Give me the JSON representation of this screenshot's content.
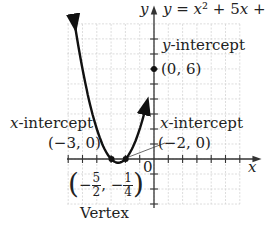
{
  "chart_data": {
    "type": "line",
    "equation_label": "y = x² + 5x +",
    "xlabel": "x",
    "ylabel": "y",
    "xlim": [
      -6,
      6
    ],
    "ylim": [
      -3,
      9
    ],
    "grid": true,
    "origin_label": "0",
    "series": [
      {
        "name": "y = x^2 + 5x + 6",
        "x": [
          -5.5,
          -5,
          -4,
          -3,
          -2.5,
          -2,
          -1,
          -0.5
        ],
        "y": [
          8.75,
          6,
          2,
          0,
          -0.25,
          0,
          2,
          3.75
        ]
      }
    ],
    "annotations": [
      {
        "label": "y-intercept",
        "point": [
          0,
          6
        ],
        "text": "(0, 6)"
      },
      {
        "label": "x-intercept",
        "point": [
          -3,
          0
        ],
        "text": "(−3, 0)"
      },
      {
        "label": "x-intercept",
        "point": [
          -2,
          0
        ],
        "text": "(−2, 0)"
      },
      {
        "label": "Vertex",
        "point": [
          -2.5,
          -0.25
        ],
        "text": "(−5/2, −1/4)"
      }
    ]
  },
  "labels": {
    "y_axis": "y",
    "x_axis": "x",
    "equation": "y = x² + 5x +",
    "y_intercept_title": "y-intercept",
    "y_intercept_point": "(0, 6)",
    "x_intercept_left_title": "x-intercept",
    "x_intercept_left_point": "(−3, 0)",
    "x_intercept_right_title": "x-intercept",
    "x_intercept_right_point": "(−2, 0)",
    "vertex_title": "Vertex",
    "vertex_x_num": "5",
    "vertex_x_den": "2",
    "vertex_y_num": "1",
    "vertex_y_den": "4",
    "origin": "0"
  }
}
